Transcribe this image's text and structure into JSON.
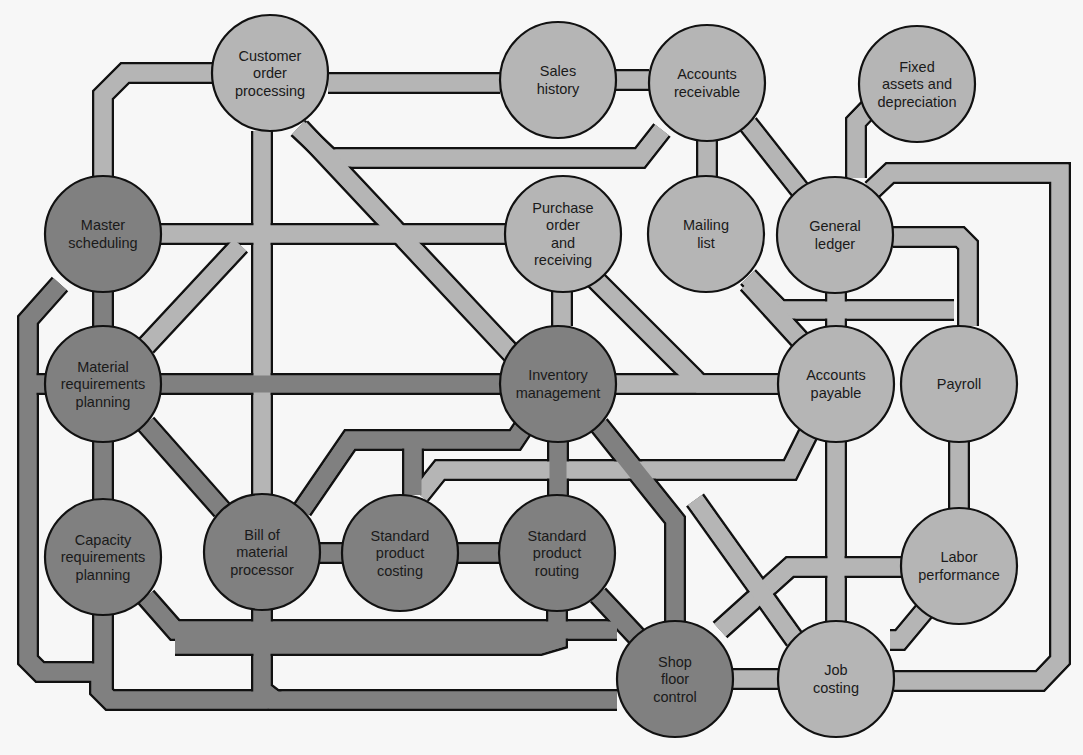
{
  "diagram": {
    "type": "information-system-flow",
    "colors": {
      "dark_node": "#808080",
      "light_node": "#b5b5b5",
      "outline": "#111111",
      "background": "#f7f7f7"
    },
    "nodes": [
      {
        "id": "customer_order",
        "lines": [
          "Customer",
          "order",
          "processing"
        ],
        "x": 270,
        "y": 73,
        "r": 58,
        "tone": "light"
      },
      {
        "id": "sales_history",
        "lines": [
          "Sales",
          "history"
        ],
        "x": 558,
        "y": 80,
        "r": 58,
        "tone": "light"
      },
      {
        "id": "accounts_receivable",
        "lines": [
          "Accounts",
          "receivable"
        ],
        "x": 707,
        "y": 83,
        "r": 58,
        "tone": "light"
      },
      {
        "id": "fixed_assets",
        "lines": [
          "Fixed",
          "assets and",
          "depreciation"
        ],
        "x": 917,
        "y": 84,
        "r": 58,
        "tone": "light"
      },
      {
        "id": "master_scheduling",
        "lines": [
          "Master",
          "scheduling"
        ],
        "x": 103,
        "y": 234,
        "r": 58,
        "tone": "dark"
      },
      {
        "id": "purchase_order",
        "lines": [
          "Purchase",
          "order",
          "and",
          "receiving"
        ],
        "x": 563,
        "y": 234,
        "r": 58,
        "tone": "light"
      },
      {
        "id": "mailing_list",
        "lines": [
          "Mailing",
          "list"
        ],
        "x": 706,
        "y": 234,
        "r": 58,
        "tone": "light"
      },
      {
        "id": "general_ledger",
        "lines": [
          "General",
          "ledger"
        ],
        "x": 835,
        "y": 235,
        "r": 58,
        "tone": "light"
      },
      {
        "id": "material_requirements",
        "lines": [
          "Material",
          "requirements",
          "planning"
        ],
        "x": 103,
        "y": 384,
        "r": 58,
        "tone": "dark"
      },
      {
        "id": "inventory_management",
        "lines": [
          "Inventory",
          "management"
        ],
        "x": 558,
        "y": 384,
        "r": 58,
        "tone": "dark"
      },
      {
        "id": "accounts_payable",
        "lines": [
          "Accounts",
          "payable"
        ],
        "x": 836,
        "y": 384,
        "r": 58,
        "tone": "light"
      },
      {
        "id": "payroll",
        "lines": [
          "Payroll"
        ],
        "x": 959,
        "y": 384,
        "r": 58,
        "tone": "light"
      },
      {
        "id": "capacity_requirements",
        "lines": [
          "Capacity",
          "requirements",
          "planning"
        ],
        "x": 103,
        "y": 557,
        "r": 58,
        "tone": "dark"
      },
      {
        "id": "bill_of_material",
        "lines": [
          "Bill of",
          "material",
          "processor"
        ],
        "x": 262,
        "y": 552,
        "r": 58,
        "tone": "dark"
      },
      {
        "id": "standard_costing",
        "lines": [
          "Standard",
          "product",
          "costing"
        ],
        "x": 400,
        "y": 553,
        "r": 58,
        "tone": "dark"
      },
      {
        "id": "standard_routing",
        "lines": [
          "Standard",
          "product",
          "routing"
        ],
        "x": 557,
        "y": 553,
        "r": 58,
        "tone": "dark"
      },
      {
        "id": "labor_performance",
        "lines": [
          "Labor",
          "performance"
        ],
        "x": 959,
        "y": 566,
        "r": 58,
        "tone": "light"
      },
      {
        "id": "shop_floor_control",
        "lines": [
          "Shop",
          "floor",
          "control"
        ],
        "x": 675,
        "y": 679,
        "r": 58,
        "tone": "dark"
      },
      {
        "id": "job_costing",
        "lines": [
          "Job",
          "costing"
        ],
        "x": 836,
        "y": 679,
        "r": 58,
        "tone": "light"
      }
    ],
    "links": [
      {
        "tone": "light",
        "pts": [
          [
            212,
            73
          ],
          [
            125,
            73
          ],
          [
            103,
            95
          ],
          [
            103,
            176
          ]
        ]
      },
      {
        "tone": "light",
        "pts": [
          [
            328,
            83
          ],
          [
            500,
            83
          ]
        ]
      },
      {
        "tone": "light",
        "pts": [
          [
            500,
            80
          ],
          [
            649,
            80
          ]
        ]
      },
      {
        "tone": "light",
        "pts": [
          [
            298,
            128
          ],
          [
            330,
            158
          ],
          [
            640,
            158
          ],
          [
            662,
            130
          ]
        ]
      },
      {
        "tone": "light",
        "pts": [
          [
            300,
            128
          ],
          [
            540,
            384
          ]
        ]
      },
      {
        "tone": "light",
        "pts": [
          [
            262,
            131
          ],
          [
            262,
            494
          ]
        ]
      },
      {
        "tone": "light",
        "pts": [
          [
            161,
            234
          ],
          [
            505,
            234
          ]
        ]
      },
      {
        "tone": "light",
        "pts": [
          [
            146,
            346
          ],
          [
            240,
            245
          ]
        ]
      },
      {
        "tone": "light",
        "pts": [
          [
            707,
            141
          ],
          [
            707,
            176
          ]
        ]
      },
      {
        "tone": "light",
        "pts": [
          [
            748,
            124
          ],
          [
            800,
            190
          ]
        ]
      },
      {
        "tone": "light",
        "pts": [
          [
            950,
            97
          ],
          [
            880,
            97
          ],
          [
            856,
            122
          ],
          [
            856,
            178
          ]
        ]
      },
      {
        "tone": "light",
        "pts": [
          [
            872,
            190
          ],
          [
            890,
            173
          ],
          [
            1060,
            173
          ],
          [
            1060,
            300
          ],
          [
            1060,
            660
          ],
          [
            1040,
            681
          ],
          [
            894,
            681
          ]
        ]
      },
      {
        "tone": "light",
        "pts": [
          [
            893,
            237
          ],
          [
            960,
            237
          ],
          [
            968,
            245
          ],
          [
            968,
            326
          ]
        ]
      },
      {
        "tone": "light",
        "pts": [
          [
            748,
            277
          ],
          [
            780,
            310
          ],
          [
            954,
            310
          ]
        ]
      },
      {
        "tone": "light",
        "pts": [
          [
            748,
            283
          ],
          [
            800,
            340
          ]
        ]
      },
      {
        "tone": "light",
        "pts": [
          [
            836,
            293
          ],
          [
            836,
            326
          ]
        ]
      },
      {
        "tone": "light",
        "pts": [
          [
            562,
            292
          ],
          [
            562,
            326
          ]
        ]
      },
      {
        "tone": "light",
        "pts": [
          [
            595,
            279
          ],
          [
            700,
            384
          ],
          [
            778,
            384
          ]
        ]
      },
      {
        "tone": "light",
        "pts": [
          [
            616,
            384
          ],
          [
            778,
            384
          ]
        ]
      },
      {
        "tone": "light",
        "pts": [
          [
            810,
            430
          ],
          [
            790,
            470
          ],
          [
            440,
            470
          ],
          [
            420,
            495
          ]
        ]
      },
      {
        "tone": "light",
        "pts": [
          [
            836,
            442
          ],
          [
            836,
            621
          ]
        ]
      },
      {
        "tone": "light",
        "pts": [
          [
            959,
            442
          ],
          [
            959,
            508
          ]
        ]
      },
      {
        "tone": "light",
        "pts": [
          [
            901,
            567
          ],
          [
            790,
            567
          ],
          [
            720,
            630
          ]
        ]
      },
      {
        "tone": "light",
        "pts": [
          [
            925,
            610
          ],
          [
            900,
            640
          ],
          [
            890,
            640
          ]
        ]
      },
      {
        "tone": "light",
        "pts": [
          [
            733,
            679
          ],
          [
            778,
            679
          ]
        ]
      },
      {
        "tone": "light",
        "pts": [
          [
            695,
            500
          ],
          [
            795,
            640
          ]
        ]
      },
      {
        "tone": "dark",
        "pts": [
          [
            103,
            292
          ],
          [
            103,
            326
          ]
        ]
      },
      {
        "tone": "dark",
        "pts": [
          [
            161,
            384
          ],
          [
            500,
            384
          ]
        ]
      },
      {
        "tone": "dark",
        "pts": [
          [
            103,
            442
          ],
          [
            103,
            499
          ]
        ]
      },
      {
        "tone": "dark",
        "pts": [
          [
            146,
            424
          ],
          [
            222,
            510
          ]
        ]
      },
      {
        "tone": "dark",
        "pts": [
          [
            60,
            284
          ],
          [
            28,
            320
          ],
          [
            28,
            660
          ],
          [
            40,
            672
          ],
          [
            100,
            672
          ],
          [
            100,
            690
          ],
          [
            110,
            700
          ],
          [
            617,
            700
          ]
        ]
      },
      {
        "tone": "dark",
        "pts": [
          [
            46,
            384
          ],
          [
            28,
            384
          ]
        ]
      },
      {
        "tone": "dark",
        "pts": [
          [
            146,
            597
          ],
          [
            175,
            630
          ],
          [
            617,
            630
          ]
        ]
      },
      {
        "tone": "dark",
        "pts": [
          [
            103,
            615
          ],
          [
            103,
            690
          ]
        ]
      },
      {
        "tone": "dark",
        "pts": [
          [
            262,
            610
          ],
          [
            262,
            690
          ],
          [
            275,
            700
          ]
        ]
      },
      {
        "tone": "dark",
        "pts": [
          [
            320,
            553
          ],
          [
            342,
            553
          ]
        ]
      },
      {
        "tone": "dark",
        "pts": [
          [
            458,
            553
          ],
          [
            499,
            553
          ]
        ]
      },
      {
        "tone": "dark",
        "pts": [
          [
            302,
            510
          ],
          [
            350,
            440
          ],
          [
            515,
            440
          ],
          [
            525,
            425
          ]
        ]
      },
      {
        "tone": "dark",
        "pts": [
          [
            413,
            495
          ],
          [
            413,
            440
          ]
        ]
      },
      {
        "tone": "dark",
        "pts": [
          [
            558,
            442
          ],
          [
            558,
            495
          ]
        ]
      },
      {
        "tone": "dark",
        "pts": [
          [
            599,
            425
          ],
          [
            675,
            520
          ],
          [
            675,
            621
          ]
        ]
      },
      {
        "tone": "dark",
        "pts": [
          [
            598,
            595
          ],
          [
            640,
            640
          ]
        ]
      },
      {
        "tone": "dark",
        "pts": [
          [
            557,
            611
          ],
          [
            557,
            640
          ],
          [
            540,
            645
          ],
          [
            175,
            645
          ]
        ]
      }
    ]
  }
}
